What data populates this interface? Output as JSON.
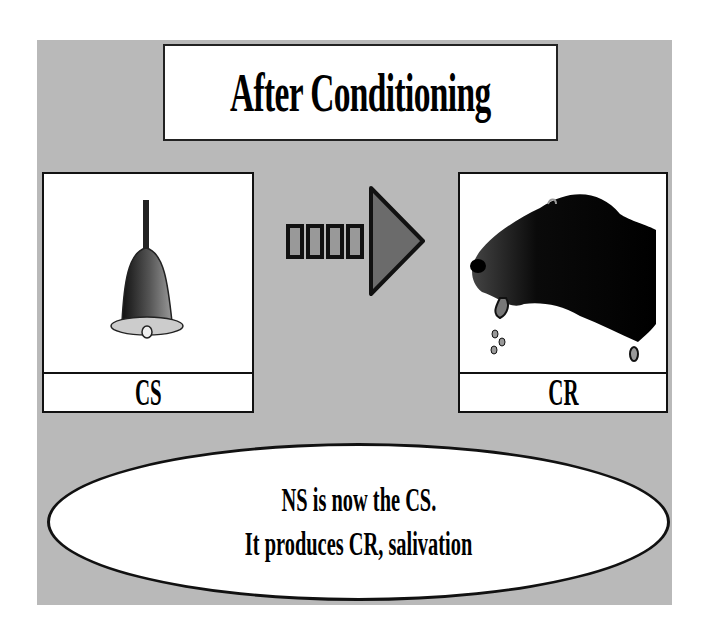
{
  "title": "After Conditioning",
  "stimulus": {
    "label": "CS",
    "image": "bell-icon"
  },
  "response": {
    "label": "CR",
    "image": "dog-salivating-icon"
  },
  "connector": {
    "icon": "arrow-right-icon",
    "dashes": 4
  },
  "caption": {
    "line1": "NS is now the CS.",
    "line2": "It produces CR, salivation"
  },
  "colors": {
    "background": "#b9b9b9",
    "arrow_fill": "#6b6b6b",
    "box_fill": "#ffffff"
  }
}
